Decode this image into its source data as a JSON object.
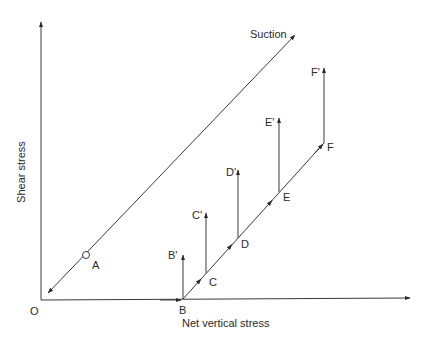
{
  "diagram": {
    "axes": {
      "x_label": "Net vertical stress",
      "y_label": "Shear stress",
      "origin_label": "O"
    },
    "suction_line": {
      "label": "Suction",
      "point_label": "A"
    },
    "stress_path": {
      "start_label": "B",
      "points": [
        {
          "label": "C",
          "prime_label": "C'"
        },
        {
          "label": "D",
          "prime_label": "D'"
        },
        {
          "label": "E",
          "prime_label": "E'"
        },
        {
          "label": "F",
          "prime_label": "F'"
        }
      ],
      "base_prime_label": "B'"
    },
    "colors": {
      "line": "#3a3a3a",
      "text": "#2a2a2a",
      "background": "#ffffff"
    }
  }
}
